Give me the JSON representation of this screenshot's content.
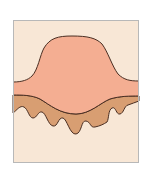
{
  "diagram": {
    "title": "",
    "layers": [
      {
        "name": "lesion-surface",
        "color": "#f4ae92"
      },
      {
        "name": "epidermis-base",
        "color": "#d89e72"
      },
      {
        "name": "dermis",
        "color": "#f8e7d6"
      }
    ],
    "outline_color": "#4a2e22",
    "frame_color": "#b8b8b8",
    "background": "#ffffff"
  }
}
